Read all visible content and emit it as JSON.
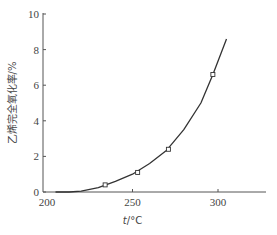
{
  "chart_data": {
    "type": "line",
    "title": "",
    "xlabel": "t/°C",
    "ylabel": "乙烯完全氧化率/%",
    "xlim": [
      200,
      315
    ],
    "ylim": [
      0,
      10
    ],
    "x_ticks": [
      200,
      250,
      300
    ],
    "y_ticks": [
      0,
      2,
      4,
      6,
      8,
      10
    ],
    "grid": false,
    "legend": null,
    "series": [
      {
        "name": "measured",
        "marker": "open-square",
        "x": [
          234,
          253,
          271,
          297
        ],
        "y": [
          0.4,
          1.1,
          2.4,
          6.6
        ]
      },
      {
        "name": "fitted-curve",
        "marker": "none",
        "x": [
          213,
          220,
          230,
          240,
          250,
          260,
          270,
          280,
          290,
          297,
          305
        ],
        "y": [
          0.0,
          0.05,
          0.25,
          0.6,
          1.0,
          1.6,
          2.35,
          3.5,
          5.0,
          6.6,
          8.6
        ]
      }
    ]
  }
}
